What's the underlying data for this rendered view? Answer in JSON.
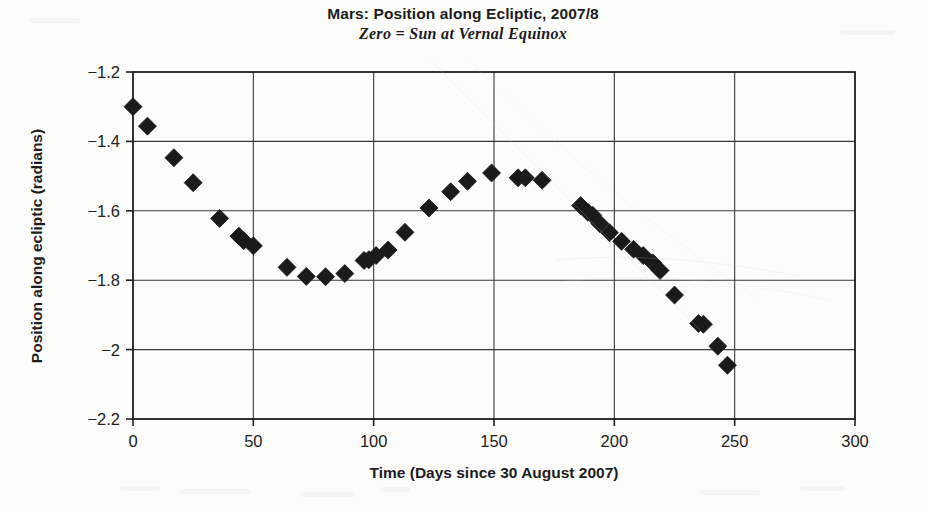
{
  "chart_data": {
    "type": "scatter",
    "title": "Mars: Position along Ecliptic, 2007/8",
    "subtitle": "Zero = Sun at Vernal Equinox",
    "xlabel": "Time (Days since 30 August 2007)",
    "ylabel": "Position along ecliptic (radians)",
    "xlim": [
      0,
      300
    ],
    "ylim": [
      -2.2,
      -1.2
    ],
    "xticks": [
      0,
      50,
      100,
      150,
      200,
      250,
      300
    ],
    "xticklabels": [
      "0",
      "50",
      "100",
      "150",
      "200",
      "250",
      "300"
    ],
    "yticks": [
      -1.2,
      -1.4,
      -1.6,
      -1.8,
      -2.0,
      -2.2
    ],
    "yticklabels": [
      "-1.2",
      "-1.4",
      "-1.6",
      "-1.8",
      "-2",
      "-2.2"
    ],
    "grid": true,
    "legend": null,
    "marker": "diamond",
    "marker_color": "#1a1a1a",
    "marker_size": 9,
    "series": [
      {
        "name": "Mars ecliptic longitude",
        "points": [
          [
            0,
            -1.3
          ],
          [
            6,
            -1.356
          ],
          [
            17,
            -1.447
          ],
          [
            25,
            -1.519
          ],
          [
            36,
            -1.622
          ],
          [
            44,
            -1.673
          ],
          [
            46,
            -1.686
          ],
          [
            50,
            -1.701
          ],
          [
            64,
            -1.763
          ],
          [
            72,
            -1.789
          ],
          [
            80,
            -1.79
          ],
          [
            88,
            -1.781
          ],
          [
            96,
            -1.743
          ],
          [
            98,
            -1.741
          ],
          [
            101,
            -1.729
          ],
          [
            106,
            -1.713
          ],
          [
            113,
            -1.662
          ],
          [
            123,
            -1.592
          ],
          [
            132,
            -1.545
          ],
          [
            139,
            -1.515
          ],
          [
            149,
            -1.491
          ],
          [
            160,
            -1.505
          ],
          [
            163,
            -1.505
          ],
          [
            170,
            -1.512
          ],
          [
            186,
            -1.585
          ],
          [
            189,
            -1.604
          ],
          [
            191,
            -1.613
          ],
          [
            194,
            -1.637
          ],
          [
            198,
            -1.663
          ],
          [
            203,
            -1.688
          ],
          [
            208,
            -1.711
          ],
          [
            212,
            -1.729
          ],
          [
            216,
            -1.75
          ],
          [
            219,
            -1.772
          ],
          [
            225,
            -1.843
          ],
          [
            235,
            -1.925
          ],
          [
            237,
            -1.927
          ],
          [
            243,
            -1.99
          ],
          [
            247,
            -2.045
          ]
        ]
      }
    ]
  }
}
